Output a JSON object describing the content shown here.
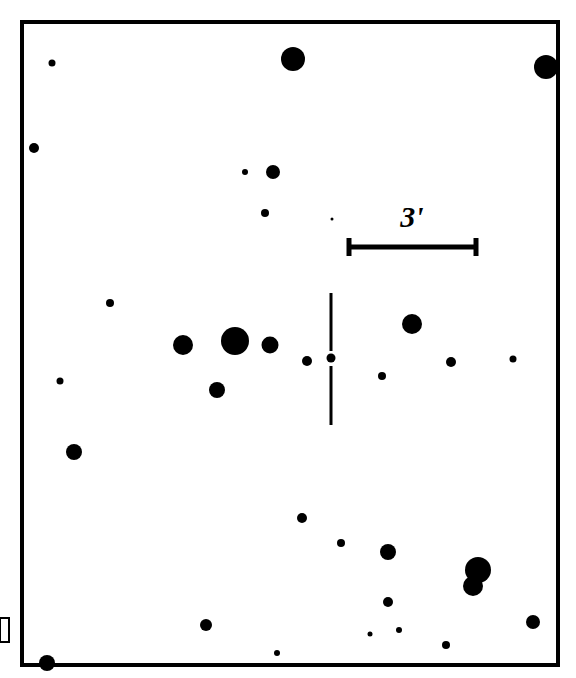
{
  "figure": {
    "kind": "astronomical-finding-chart",
    "background_color": "#ffffff",
    "ink_color": "#000000",
    "width": 576,
    "height": 678
  },
  "frame": {
    "x": 22,
    "y": 22,
    "width": 536,
    "height": 643,
    "stroke_width": 4,
    "color": "#000000"
  },
  "scale_bar": {
    "label": "3'",
    "label_x": 412,
    "label_y": 227,
    "x1": 349,
    "x2": 476,
    "y": 247,
    "cap_half_height": 9,
    "stroke_width": 5
  },
  "target_marker": {
    "name": "crosshair-tick",
    "x": 331,
    "line_top_y": 293,
    "line_gap_top_y": 351,
    "line_gap_bottom_y": 366,
    "line_bottom_y": 425,
    "stroke_width": 3,
    "object_dot_x": 331,
    "object_dot_y": 358,
    "object_dot_r": 4.5
  },
  "edge_artifact": {
    "x": 0,
    "y": 618,
    "width": 9,
    "height": 24,
    "stroke_width": 2
  },
  "chart_data": {
    "type": "scatter",
    "title": "",
    "subtitle": "",
    "xlabel": "",
    "ylabel": "",
    "grid": false,
    "legend": null,
    "annotations": [
      {
        "text": "3'",
        "role": "scale-bar-label",
        "x": 412,
        "y": 227
      }
    ],
    "axis_note": "Positions given in image pixel coordinates; marker radius encodes apparent brightness (larger = brighter).",
    "xlim": [
      22,
      558
    ],
    "ylim": [
      22,
      665
    ],
    "series": [
      {
        "name": "field-stars",
        "points": [
          {
            "x": 52,
            "y": 63,
            "r": 3.5
          },
          {
            "x": 293,
            "y": 59,
            "r": 12.0
          },
          {
            "x": 546,
            "y": 67,
            "r": 12.0
          },
          {
            "x": 34,
            "y": 148,
            "r": 5.0
          },
          {
            "x": 245,
            "y": 172,
            "r": 3.0
          },
          {
            "x": 273,
            "y": 172,
            "r": 7.0
          },
          {
            "x": 265,
            "y": 213,
            "r": 4.0
          },
          {
            "x": 332,
            "y": 219,
            "r": 1.5
          },
          {
            "x": 110,
            "y": 303,
            "r": 4.0
          },
          {
            "x": 412,
            "y": 324,
            "r": 10.0
          },
          {
            "x": 235,
            "y": 341,
            "r": 14.0
          },
          {
            "x": 183,
            "y": 345,
            "r": 10.0
          },
          {
            "x": 270,
            "y": 345,
            "r": 8.5
          },
          {
            "x": 513,
            "y": 359,
            "r": 3.5
          },
          {
            "x": 451,
            "y": 362,
            "r": 5.0
          },
          {
            "x": 307,
            "y": 361,
            "r": 5.0
          },
          {
            "x": 382,
            "y": 376,
            "r": 4.0
          },
          {
            "x": 217,
            "y": 390,
            "r": 8.0
          },
          {
            "x": 60,
            "y": 381,
            "r": 3.5
          },
          {
            "x": 74,
            "y": 452,
            "r": 8.0
          },
          {
            "x": 302,
            "y": 518,
            "r": 5.0
          },
          {
            "x": 341,
            "y": 543,
            "r": 4.0
          },
          {
            "x": 388,
            "y": 552,
            "r": 8.0
          },
          {
            "x": 478,
            "y": 570,
            "r": 13.0
          },
          {
            "x": 473,
            "y": 586,
            "r": 10.0
          },
          {
            "x": 388,
            "y": 602,
            "r": 5.0
          },
          {
            "x": 533,
            "y": 622,
            "r": 7.0
          },
          {
            "x": 206,
            "y": 625,
            "r": 6.0
          },
          {
            "x": 399,
            "y": 630,
            "r": 3.0
          },
          {
            "x": 370,
            "y": 634,
            "r": 2.5
          },
          {
            "x": 446,
            "y": 645,
            "r": 4.0
          },
          {
            "x": 277,
            "y": 653,
            "r": 3.0
          },
          {
            "x": 47,
            "y": 663,
            "r": 8.0
          }
        ]
      },
      {
        "name": "target-object",
        "points": [
          {
            "x": 331,
            "y": 358,
            "r": 4.5
          }
        ]
      }
    ]
  }
}
